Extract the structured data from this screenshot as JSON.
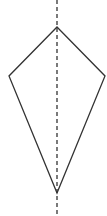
{
  "diagram": {
    "type": "kite-with-axis-of-symmetry",
    "background": "#ffffff",
    "stroke_color": "#333333",
    "shape": {
      "name": "kite",
      "vertices": {
        "top": [
          57,
          27
        ],
        "right": [
          105,
          76
        ],
        "bottom": [
          57,
          193
        ],
        "left": [
          9,
          76
        ]
      }
    },
    "symmetry_line": {
      "style": "dashed",
      "x": 57,
      "y_start": 0,
      "y_end": 216
    }
  }
}
